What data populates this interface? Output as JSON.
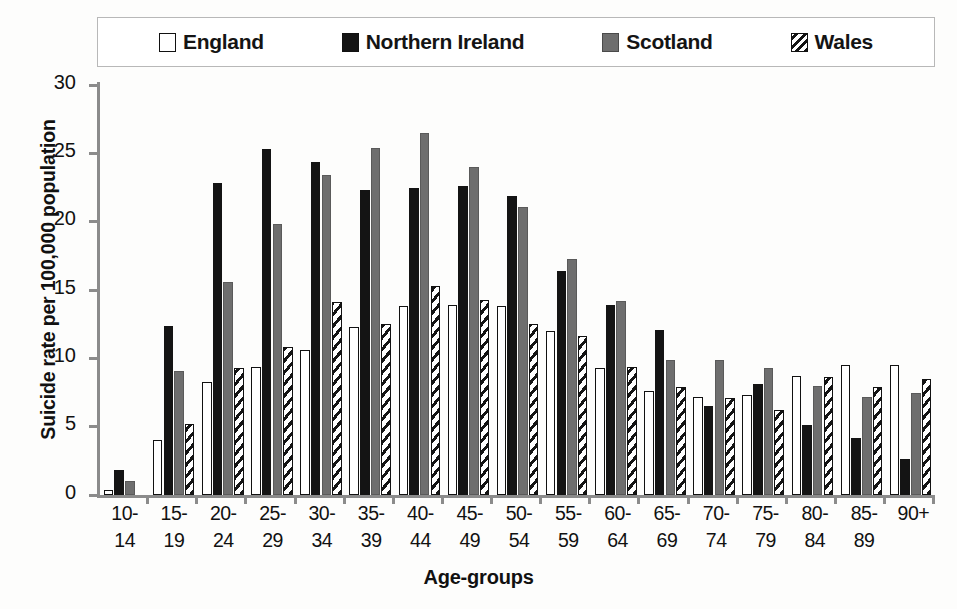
{
  "chart_data": {
    "type": "bar",
    "title": "",
    "xlabel": "Age-groups",
    "ylabel": "Suicide rate per 100,000 population",
    "ylim": [
      0,
      30
    ],
    "yticks": [
      0,
      5,
      10,
      15,
      20,
      25,
      30
    ],
    "grid": false,
    "legend_position": "top",
    "categories": [
      "10-14",
      "15-19",
      "20-24",
      "25-29",
      "30-34",
      "35-39",
      "40-44",
      "45-49",
      "50-54",
      "55-59",
      "60-64",
      "65-69",
      "70-74",
      "75-79",
      "80-84",
      "85-89",
      "90+"
    ],
    "series": [
      {
        "name": "England",
        "color": "#ffffff",
        "pattern": "solid-outline",
        "values": [
          0.4,
          4.0,
          8.3,
          9.4,
          10.6,
          12.3,
          13.8,
          13.9,
          13.8,
          12.0,
          9.3,
          7.6,
          7.2,
          7.3,
          8.7,
          9.5,
          9.5
        ]
      },
      {
        "name": "Northern Ireland",
        "color": "#141414",
        "pattern": "solid-black",
        "values": [
          1.8,
          12.4,
          22.8,
          25.3,
          24.4,
          22.3,
          22.5,
          22.6,
          21.9,
          16.4,
          13.9,
          12.1,
          6.5,
          8.1,
          5.1,
          4.2,
          2.6
        ]
      },
      {
        "name": "Scotland",
        "color": "#6e6e6e",
        "pattern": "solid-gray",
        "values": [
          1.0,
          9.1,
          15.6,
          19.8,
          23.4,
          25.4,
          26.5,
          24.0,
          21.1,
          17.3,
          14.2,
          9.9,
          9.9,
          9.3,
          8.0,
          7.2,
          7.5
        ]
      },
      {
        "name": "Wales",
        "color": "#141414",
        "pattern": "diagonal-hatch",
        "values": [
          0.0,
          5.2,
          9.3,
          10.8,
          14.1,
          12.5,
          15.3,
          14.3,
          12.5,
          11.6,
          9.4,
          7.9,
          7.1,
          6.2,
          8.6,
          7.9,
          8.5
        ]
      }
    ]
  },
  "legend": {
    "items": [
      {
        "label": "England",
        "swatch": "england-swatch-icon"
      },
      {
        "label": "Northern Ireland",
        "swatch": "northern-ireland-swatch-icon"
      },
      {
        "label": "Scotland",
        "swatch": "scotland-swatch-icon"
      },
      {
        "label": "Wales",
        "swatch": "wales-swatch-icon"
      }
    ]
  },
  "axes": {
    "y_title": "Suicide rate per 100,000 population",
    "x_title": "Age-groups"
  }
}
